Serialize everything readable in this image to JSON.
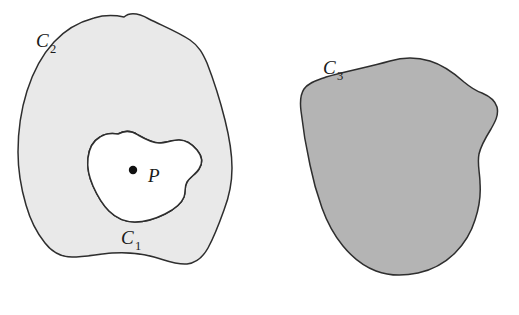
{
  "figure": {
    "background_color": "#ffffff",
    "outline_color": "#2e2e2e",
    "left_panel": {
      "name": "annulus-region",
      "outer_curve": {
        "label_letter": "C",
        "label_subscript": "2",
        "label_x": 36,
        "label_y": 47,
        "fill_color": "#e9e9e9",
        "path": "M 124,17 C 131,11 140,14 149,19 C 163,26 178,32 190,40 C 199,46 203,54 207,63 C 214,81 220,100 225,120 C 229,136 232,152 232,168 C 232,183 229,197 224,210 C 219,224 214,237 208,248 C 203,257 196,263 187,264 C 176,265 165,260 154,257 C 140,253 126,252 112,253 C 98,254 85,257 72,257 C 61,257 52,252 45,243 C 36,232 30,219 26,205 C 21,188 18,170 18,152 C 18,131 21,110 27,91 C 33,72 42,55 54,42 C 65,30 79,22 94,18 C 104,15 114,15 124,17 Z"
      },
      "inner_curve": {
        "label_letter": "C",
        "label_subscript": "1",
        "label_x": 121,
        "label_y": 244,
        "fill_color": "#ffffff",
        "path": "M 118,134 C 125,130 132,131 138,135 C 145,139 152,143 159,143 C 166,143 172,140 179,140 C 186,140 192,144 197,150 C 202,156 203,163 199,169 C 196,174 190,177 187,182 C 184,187 186,192 184,197 C 181,205 173,210 165,214 C 155,219 145,222 135,222 C 125,222 116,218 109,211 C 102,204 97,195 93,186 C 89,177 87,167 88,158 C 89,149 93,141 100,137 C 106,133 112,133 118,134 Z"
      },
      "point": {
        "name": "point-P",
        "label": "P",
        "dot_x": 133,
        "dot_y": 170,
        "dot_radius": 4.2,
        "label_x": 148,
        "label_y": 182
      }
    },
    "right_panel": {
      "name": "simply-connected-region",
      "curve": {
        "label_letter": "C",
        "label_subscript": "3",
        "label_x": 323,
        "label_y": 74,
        "fill_color": "#b4b4b4",
        "path": "M 390,61 C 403,57 417,57 430,61 C 443,65 454,73 464,82 C 470,87 476,91 482,93 C 489,96 495,100 497,107 C 499,115 495,122 491,129 C 486,137 481,145 479,154 C 477,164 480,173 480,183 C 481,196 479,208 475,220 C 471,233 464,244 455,253 C 445,263 432,270 418,273 C 404,276 389,276 376,271 C 363,266 352,257 343,246 C 334,235 327,222 322,208 C 317,194 313,180 310,165 C 306,147 303,129 301,111 C 300,103 300,95 304,89 C 309,82 318,80 326,77 C 347,71 369,67 390,61 Z"
      }
    }
  }
}
